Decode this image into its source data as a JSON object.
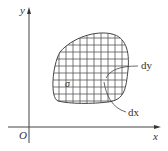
{
  "figure": {
    "type": "double-integral-region-diagram",
    "axes": {
      "x_label": "x",
      "y_label": "y",
      "origin_label": "O"
    },
    "region": {
      "label": "σ",
      "grid": "rectangular subdivision"
    },
    "annotations": {
      "dy_label": "dy",
      "dx_label": "dx"
    },
    "colors": {
      "line": "#444444",
      "grid": "#555555",
      "text": "#333333",
      "background": "#ffffff"
    }
  }
}
